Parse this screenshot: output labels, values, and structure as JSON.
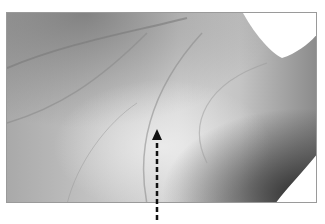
{
  "figure": {
    "annotation": {
      "type": "dashed-arrow",
      "direction": "up",
      "points_to": "palm crease",
      "color": "#111111"
    },
    "frame_border_color": "#9a9a9a"
  }
}
